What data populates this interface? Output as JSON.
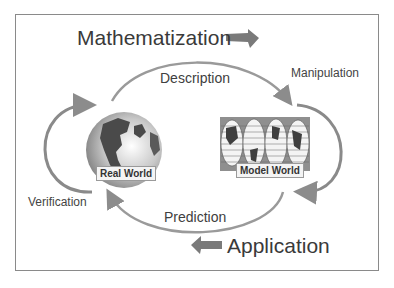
{
  "diagram": {
    "headings": {
      "mathematization": "Mathematization",
      "application": "Application"
    },
    "cycle_labels": {
      "description": "Description",
      "prediction": "Prediction",
      "manipulation": "Manipulation",
      "verification": "Verification"
    },
    "nodes": {
      "real_world": "Real World",
      "model_world": "Model World"
    },
    "colors": {
      "arrow": "#8c8c8c",
      "block_arrow": "#7a7a7a",
      "frame": "#8a8a8a",
      "globe_ocean": "#b8b8b8",
      "globe_land": "#4a4a4a",
      "map_bg": "#8f8f8f"
    }
  }
}
